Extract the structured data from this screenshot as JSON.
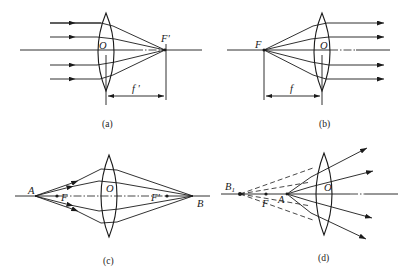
{
  "figure": {
    "panels": [
      {
        "id": "a",
        "caption": "(a)",
        "description": "Parallel rays converge through convex lens to image focal point F'",
        "labels": {
          "center": "O",
          "focus": "F'",
          "focal_length": "f '"
        }
      },
      {
        "id": "b",
        "caption": "(b)",
        "description": "Rays diverging from object focal point F emerge parallel after convex lens",
        "labels": {
          "center": "O",
          "focus": "F",
          "focal_length": "f"
        }
      },
      {
        "id": "c",
        "caption": "(c)",
        "description": "Point A outside focal length imaged to real point B",
        "labels": {
          "center": "O",
          "object": "A",
          "image": "B",
          "focus_left": "F",
          "focus_right": "F'"
        }
      },
      {
        "id": "d",
        "caption": "(d)",
        "description": "Point A inside focal length forms virtual image B1 (dashed extensions)",
        "labels": {
          "center": "O",
          "object": "A",
          "virtual_image": "B",
          "virtual_image_sub": "1",
          "focus": "F"
        }
      }
    ]
  },
  "colors": {
    "ink": "#1a1a1a",
    "background": "#ffffff"
  }
}
